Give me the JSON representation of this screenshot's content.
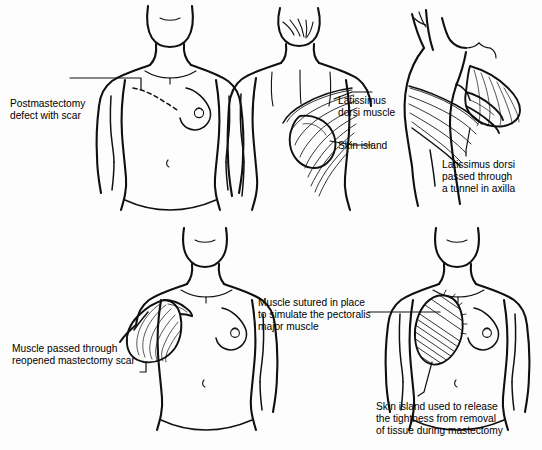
{
  "figure": {
    "background_color": "#fdfdfd",
    "ink_color": "#101010",
    "panel_count": 5
  },
  "labels": {
    "postmastectomy": {
      "lines": [
        "Postmastectomy",
        "defect with scar"
      ],
      "line1": "Postmastectomy",
      "line2": "defect with scar"
    },
    "latissimus_muscle": {
      "lines": [
        "Latissimus",
        "dorsi muscle"
      ],
      "line1": "Latissimus",
      "line2": "dorsi muscle"
    },
    "skin_island": {
      "lines": [
        "Skin island"
      ],
      "line1": "Skin island"
    },
    "tunnel_axilla": {
      "lines": [
        "Latissimus dorsi",
        "passed through",
        "a tunnel in axilla"
      ],
      "line1": "Latissimus dorsi",
      "line2": "passed through",
      "line3": "a tunnel in axilla"
    },
    "reopened_scar": {
      "lines": [
        "Muscle passed through",
        "reopened mastectomy scar"
      ],
      "line1": "Muscle passed through",
      "line2": "reopened mastectomy scar"
    },
    "sutured_pectoralis": {
      "lines": [
        "Muscle sutured in place",
        "to simulate the pectoralis",
        "major muscle"
      ],
      "line1": "Muscle sutured in place",
      "line2": "to simulate the pectoralis",
      "line3": "major muscle"
    },
    "release_tightness": {
      "lines": [
        "Skin island used to release",
        "the tightness from removal",
        "of tissue during mastectomy"
      ],
      "line1": "Skin island used to release",
      "line2": "the tightness from removal",
      "line3": "of tissue during mastectomy"
    }
  },
  "panels": [
    {
      "id": "panel-postmastectomy-front",
      "view": "anterior torso",
      "description": "Female torso with flat left chest and dashed mastectomy scar, intact right breast"
    },
    {
      "id": "panel-back-latissimus",
      "view": "posterior torso",
      "description": "Back view showing latissimus dorsi muscle fibers and outlined skin island"
    },
    {
      "id": "panel-axilla-tunnel",
      "view": "lateral with arm raised",
      "description": "Side view of flap passed through a tunnel in the axilla"
    },
    {
      "id": "panel-flap-through-scar",
      "view": "anterior torso",
      "description": "Muscle flap delivered through the reopened mastectomy scar"
    },
    {
      "id": "panel-flap-sutured",
      "view": "anterior torso",
      "description": "Muscle sutured in place over the chest wall to simulate pectoralis major"
    }
  ]
}
